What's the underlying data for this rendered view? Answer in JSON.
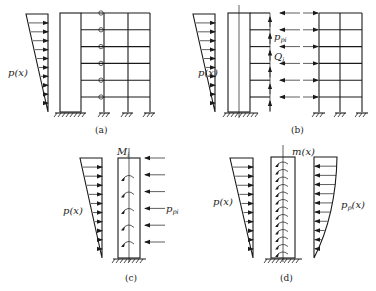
{
  "figure": {
    "panels": [
      {
        "id": "a",
        "caption": "(a)",
        "load_label": "p(x)",
        "stories": 6,
        "description": "Frame-wall structure: shear wall linked to frame through pin-ended links"
      },
      {
        "id": "b",
        "caption": "(b)",
        "load_label": "p(x)",
        "interaction_force_label": "p",
        "interaction_force_sub": "pi",
        "shear_label": "Q",
        "shear_sub": "i",
        "stories": 6,
        "description": "Separated wall and frame with interaction forces"
      },
      {
        "id": "c",
        "caption": "(c)",
        "load_label": "p(x)",
        "moment_label": "M",
        "moment_sub": "i",
        "force_label": "p",
        "force_sub": "pi",
        "description": "Wall with discrete concentrated forces and moments"
      },
      {
        "id": "d",
        "caption": "(d)",
        "load_label": "p(x)",
        "distributed_moment_label": "m(x)",
        "distributed_force_label": "p",
        "distributed_force_sub": "p",
        "distributed_force_suffix": "(x)",
        "description": "Continuous model with distributed moment and force"
      }
    ]
  }
}
